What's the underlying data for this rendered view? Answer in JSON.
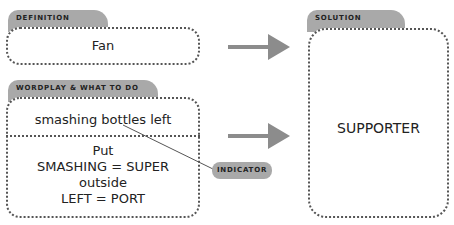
{
  "definition": {
    "label": "DEFINITION",
    "text": "Fan"
  },
  "wordplay": {
    "label": "WORDPLAY & WHAT TO DO",
    "clue_fragment": "smashing bottles left",
    "instructions": [
      "Put",
      "SMASHING = SUPER",
      "outside",
      "LEFT = PORT"
    ]
  },
  "indicator": {
    "label": "INDICATOR"
  },
  "solution": {
    "label": "SOLUTION",
    "text": "SUPPORTER"
  },
  "colors": {
    "tab": "#a9a9a9",
    "arrow": "#8c8c8c",
    "border": "#555555"
  }
}
